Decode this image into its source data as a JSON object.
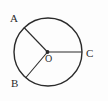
{
  "figure": {
    "type": "geometry-diagram",
    "background_color": "#fdfdfd",
    "stroke_color": "#2b2b2b",
    "labels": {
      "point_a": "A",
      "point_b": "B",
      "point_c": "C",
      "center_o": "O"
    },
    "geometry": {
      "circle": {
        "center_x": 48,
        "center_y": 52,
        "radius": 34,
        "stroke_width": 1.4
      },
      "center_dot": {
        "cx": 47.5,
        "cy": 52,
        "r": 1.9
      },
      "radii": [
        {
          "name": "OA",
          "from_x": 47.5,
          "from_y": 52,
          "to_x": 24.0,
          "to_y": 27.5
        },
        {
          "name": "OB",
          "from_x": 47.5,
          "from_y": 52,
          "to_x": 25.5,
          "to_y": 78.0
        },
        {
          "name": "OC",
          "from_x": 47.5,
          "from_y": 52,
          "to_x": 82.0,
          "to_y": 52.0
        }
      ]
    }
  }
}
